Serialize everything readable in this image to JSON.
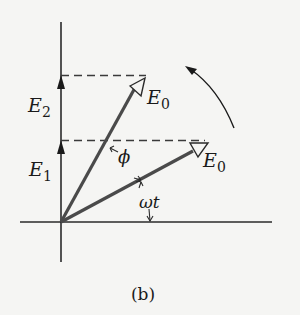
{
  "figure": {
    "caption": "(b)"
  },
  "labels": {
    "e2": {
      "main": "E",
      "sub": "2"
    },
    "e1": {
      "main": "E",
      "sub": "1"
    },
    "e0_upper": {
      "main": "E",
      "sub": "0"
    },
    "e0_lower": {
      "main": "E",
      "sub": "0"
    },
    "phi": "ϕ",
    "omega_t": "ωt"
  },
  "colors": {
    "axis": "#2a2a2a",
    "phasor": "#4a4a4a",
    "dashed": "#3a3a3a",
    "background": "#f5f5f3"
  },
  "geometry": {
    "origin": [
      61,
      222
    ],
    "phasor_upper_tip": [
      138,
      80
    ],
    "phasor_lower_tip": [
      198,
      148
    ],
    "e2_level_y": 76,
    "e1_level_y": 141
  }
}
